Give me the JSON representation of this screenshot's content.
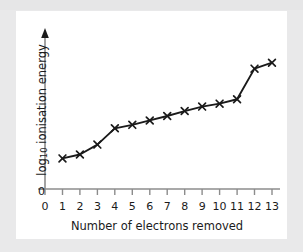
{
  "figure": {
    "panel_background": "#ffffff",
    "page_background": "#e9e9ea",
    "ink_color": "#1a1a1a",
    "axis_color": "#8c8c8c"
  },
  "chart_data": {
    "type": "line",
    "title": "",
    "subtitle": "",
    "xlabel": "Number of electrons removed",
    "ylabel": "log10 ionisation energy",
    "ylabel_prefix": "log",
    "ylabel_subscript": "10",
    "ylabel_suffix": " ionisation energy",
    "x": [
      1,
      2,
      3,
      4,
      5,
      6,
      7,
      8,
      9,
      10,
      11,
      12,
      13
    ],
    "values": [
      0.62,
      0.7,
      0.9,
      1.23,
      1.3,
      1.39,
      1.48,
      1.58,
      1.67,
      1.73,
      1.82,
      2.44,
      2.56
    ],
    "xticks": [
      "0",
      "1",
      "2",
      "3",
      "4",
      "5",
      "6",
      "7",
      "8",
      "9",
      "10",
      "11",
      "12",
      "13"
    ],
    "xtick_values": [
      0,
      1,
      2,
      3,
      4,
      5,
      6,
      7,
      8,
      9,
      10,
      11,
      12,
      13
    ],
    "yticks": [
      "0"
    ],
    "ytick_values": [
      0
    ],
    "xlim": [
      0,
      13.6
    ],
    "ylim": [
      0,
      3.0
    ],
    "grid": false,
    "legend": false,
    "legend_position": "none",
    "marker": "x",
    "line_color": "#1a1a1a",
    "marker_color": "#1a1a1a",
    "annotations": []
  }
}
